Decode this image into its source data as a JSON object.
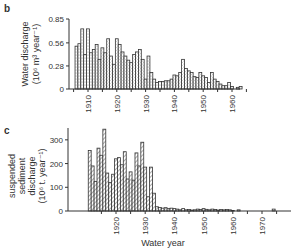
{
  "chart_data": [
    {
      "panel": "b",
      "type": "bar",
      "title": "",
      "xlabel": "",
      "ylabel": "Water discharge (10^6 m^3 year^-1)",
      "ylabel_line1": "Water discharge",
      "ylabel_line2": "(10⁶ m³ year⁻¹)",
      "ylim": [
        0,
        0.85
      ],
      "yticks": [
        0,
        0.28,
        0.56,
        0.85
      ],
      "ytick_labels": [
        "0",
        "0.28",
        "0.56",
        "0.85"
      ],
      "xticks": [
        1910,
        1920,
        1930,
        1940,
        1950,
        1960
      ],
      "grid": false,
      "fill": "stippled",
      "x": [
        1906,
        1907,
        1908,
        1909,
        1910,
        1911,
        1912,
        1913,
        1914,
        1915,
        1916,
        1917,
        1918,
        1919,
        1920,
        1921,
        1922,
        1923,
        1924,
        1925,
        1926,
        1927,
        1928,
        1929,
        1930,
        1931,
        1932,
        1933,
        1934,
        1935,
        1936,
        1937,
        1938,
        1939,
        1940,
        1941,
        1942,
        1943,
        1944,
        1945,
        1946,
        1947,
        1948,
        1949,
        1950,
        1951,
        1952,
        1953,
        1954,
        1955,
        1956,
        1957,
        1958,
        1959,
        1960,
        1961,
        1962,
        1963
      ],
      "values": [
        0.52,
        0.55,
        0.73,
        0.42,
        0.73,
        0.44,
        0.48,
        0.54,
        0.36,
        0.5,
        0.44,
        0.61,
        0.4,
        0.3,
        0.61,
        0.54,
        0.45,
        0.4,
        0.35,
        0.32,
        0.42,
        0.45,
        0.48,
        0.36,
        0.12,
        0.4,
        0.2,
        0.12,
        0.08,
        0.09,
        0.09,
        0.1,
        0.1,
        0.12,
        0.17,
        0.16,
        0.2,
        0.36,
        0.25,
        0.22,
        0.2,
        0.15,
        0.14,
        0.2,
        0.16,
        0.14,
        0.08,
        0.2,
        0.12,
        0.09,
        0.06,
        0.04,
        0.04,
        0.08,
        0.03,
        0.0,
        0.02,
        0.03
      ]
    },
    {
      "panel": "c",
      "type": "bar",
      "title": "",
      "xlabel": "Water year",
      "ylabel": "suspended sediment discharge (10^6 t. year^-1)",
      "ylabel_line1": "suspended",
      "ylabel_line2": "sediment",
      "ylabel_line3": "discharge",
      "ylabel_line4": "(10⁶ t. year⁻¹)",
      "ylim": [
        0,
        350
      ],
      "yticks": [
        0,
        100,
        200,
        300
      ],
      "ytick_labels": [
        "0",
        "100",
        "200",
        "300"
      ],
      "xticks": [
        1920,
        1930,
        1940,
        1950,
        1960,
        1970
      ],
      "grid": false,
      "fill": "hatched",
      "x": [
        1911,
        1912,
        1913,
        1914,
        1915,
        1916,
        1917,
        1918,
        1919,
        1920,
        1921,
        1922,
        1923,
        1924,
        1925,
        1926,
        1927,
        1928,
        1929,
        1930,
        1931,
        1932,
        1933,
        1934,
        1935,
        1936,
        1937,
        1938,
        1939,
        1940,
        1941,
        1942,
        1943,
        1944,
        1945,
        1946,
        1947,
        1948,
        1949,
        1950,
        1951,
        1952,
        1953,
        1954,
        1955,
        1956,
        1957,
        1958,
        1959,
        1960,
        1961,
        1962,
        1974
      ],
      "values": [
        255,
        190,
        125,
        265,
        235,
        345,
        160,
        120,
        155,
        220,
        225,
        195,
        250,
        135,
        165,
        130,
        245,
        190,
        290,
        185,
        60,
        185,
        75,
        18,
        15,
        12,
        14,
        10,
        12,
        10,
        8,
        5,
        10,
        5,
        6,
        4,
        5,
        8,
        6,
        10,
        7,
        5,
        8,
        6,
        4,
        6,
        5,
        6,
        5,
        2,
        0,
        5,
        8
      ]
    }
  ],
  "labels": {
    "panel_b": "b",
    "panel_c": "c",
    "x_axis_title": "Water year"
  }
}
